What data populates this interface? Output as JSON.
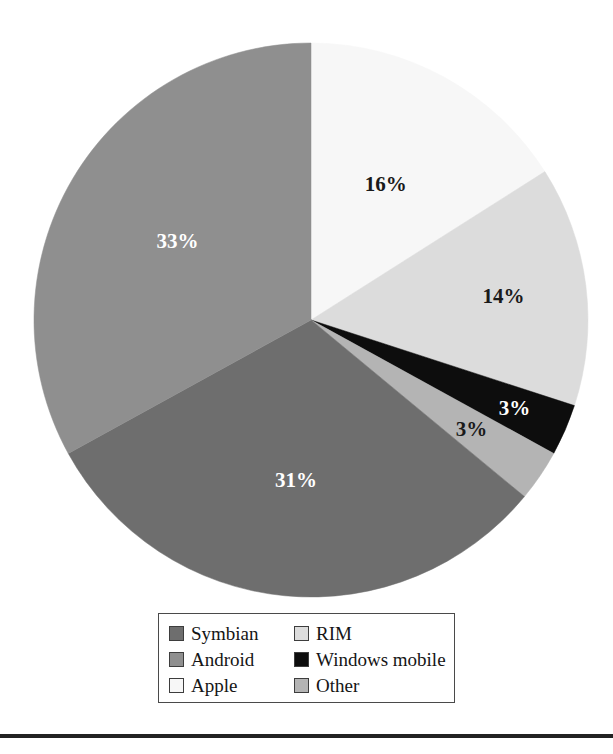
{
  "chart_data": {
    "type": "pie",
    "title": "",
    "subtitle": "",
    "xlabel": "",
    "ylabel": "",
    "units": "percent",
    "legend_position": "bottom",
    "grid": false,
    "start_angle_deg": 0,
    "direction": "clockwise",
    "categories": [
      "Apple",
      "RIM",
      "Windows mobile",
      "Other",
      "Symbian",
      "Android"
    ],
    "values": [
      16,
      14,
      3,
      3,
      31,
      33
    ],
    "labels": [
      "16%",
      "14%",
      "3%",
      "3%",
      "31%",
      "33%"
    ],
    "slices": [
      {
        "name": "Apple",
        "value": 16,
        "label": "16%",
        "color": "#f7f7f7",
        "label_color": "#1a1a1a",
        "label_tone": "dark"
      },
      {
        "name": "RIM",
        "value": 14,
        "label": "14%",
        "color": "#dcdcdc",
        "label_color": "#1a1a1a",
        "label_tone": "dark"
      },
      {
        "name": "Windows mobile",
        "value": 3,
        "label": "3%",
        "color": "#0d0d0d",
        "label_color": "#ffffff",
        "label_tone": "light"
      },
      {
        "name": "Other",
        "value": 3,
        "label": "3%",
        "color": "#b4b4b4",
        "label_color": "#1a1a1a",
        "label_tone": "dark"
      },
      {
        "name": "Symbian",
        "value": 31,
        "label": "31%",
        "color": "#6e6e6e",
        "label_color": "#ffffff",
        "label_tone": "light"
      },
      {
        "name": "Android",
        "value": 33,
        "label": "33%",
        "color": "#8f8f8f",
        "label_color": "#ffffff",
        "label_tone": "light"
      }
    ]
  },
  "legend": {
    "columns": 2,
    "rows": 3,
    "entries": [
      {
        "label": "Symbian",
        "color": "#6e6e6e"
      },
      {
        "label": "RIM",
        "color": "#dcdcdc"
      },
      {
        "label": "Android",
        "color": "#8f8f8f"
      },
      {
        "label": "Windows mobile",
        "color": "#0d0d0d"
      },
      {
        "label": "Apple",
        "color": "#f7f7f7"
      },
      {
        "label": "Other",
        "color": "#b4b4b4"
      }
    ]
  },
  "rule": {
    "color": "#222222"
  }
}
